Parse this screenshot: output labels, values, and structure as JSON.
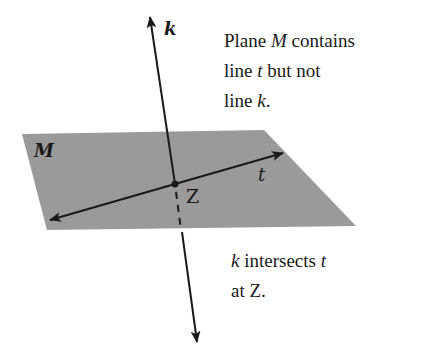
{
  "diagram": {
    "plane": {
      "label": "M",
      "fill": "#9a9a9a",
      "points": [
        [
          22,
          134
        ],
        [
          264,
          130
        ],
        [
          356,
          226
        ],
        [
          47,
          230
        ]
      ]
    },
    "line_k": {
      "label": "k",
      "top": [
        150,
        16
      ],
      "bottom": [
        197,
        343
      ]
    },
    "line_t": {
      "label": "t",
      "left": [
        50,
        220
      ],
      "right": [
        283,
        153
      ]
    },
    "point_Z": {
      "label": "Z",
      "at": [
        175,
        184
      ]
    },
    "stroke_color": "#1a1a1a"
  },
  "captions": {
    "top": {
      "line1_a": "Plane ",
      "line1_b": "M",
      "line1_c": " contains",
      "line2_a": "line ",
      "line2_b": "t",
      "line2_c": " but not",
      "line3_a": "line ",
      "line3_b": "k",
      "line3_c": "."
    },
    "bottom": {
      "line1_a": "k",
      "line1_b": " intersects ",
      "line1_c": "t",
      "line2_a": "at ",
      "line2_b": "Z",
      "line2_c": "."
    }
  }
}
